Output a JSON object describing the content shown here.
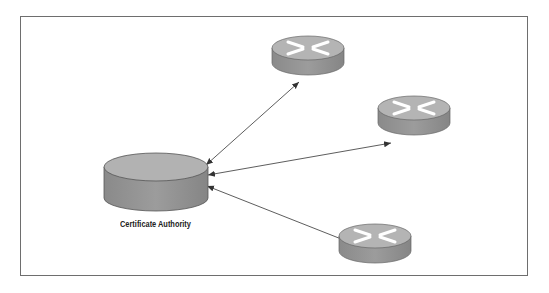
{
  "diagram": {
    "type": "network-topology",
    "nodes": [
      {
        "id": "ca",
        "kind": "server-disk",
        "label": "Certificate Authority"
      },
      {
        "id": "router-1",
        "kind": "router",
        "label": ""
      },
      {
        "id": "router-2",
        "kind": "router",
        "label": ""
      },
      {
        "id": "router-3",
        "kind": "router",
        "label": ""
      }
    ],
    "edges": [
      {
        "from": "ca",
        "to": "router-1",
        "style": "bidirectional-arrow"
      },
      {
        "from": "ca",
        "to": "router-2",
        "style": "bidirectional-arrow"
      },
      {
        "from": "ca",
        "to": "router-3",
        "style": "bidirectional-arrow"
      }
    ],
    "colors": {
      "device_top": "#b4b4b4",
      "device_side": "#8f8f8f",
      "outline": "#555555",
      "frame": "#6e6e6e"
    }
  }
}
